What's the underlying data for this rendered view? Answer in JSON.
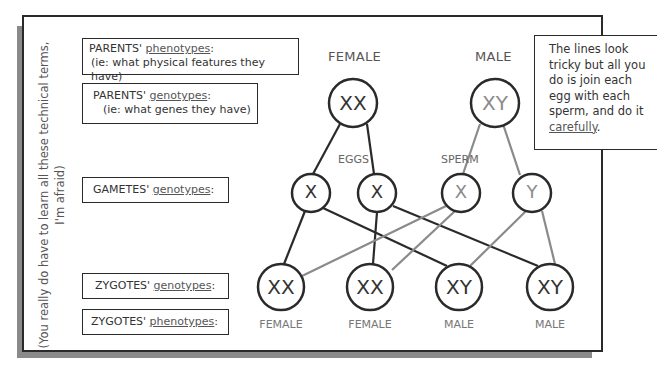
{
  "side_note": {
    "line1": "(You really do have to learn all these technical terms,",
    "line2": "I'm afraid)"
  },
  "labels": {
    "parents_phenotypes": {
      "prefix": "PARENTS' ",
      "term": "phenotypes",
      "suffix": ":",
      "sub": "(ie: what physical features they have)"
    },
    "parents_genotypes": {
      "prefix": "PARENTS' ",
      "term": "genotypes",
      "suffix": ":",
      "sub": "(ie: what genes they have)"
    },
    "gametes_genotypes": {
      "prefix": "GAMETES' ",
      "term": "genotypes",
      "suffix": ":"
    },
    "zygotes_genotypes": {
      "prefix": "ZYGOTES' ",
      "term": "genotypes",
      "suffix": ":"
    },
    "zygotes_phenotypes": {
      "prefix": "ZYGOTES' ",
      "term": "phenotypes",
      "suffix": ":"
    }
  },
  "parents": {
    "female": {
      "label": "FEMALE",
      "genotype": "XX"
    },
    "male": {
      "label": "MALE",
      "genotype": "XY"
    }
  },
  "gamete_groups": {
    "eggs": "EGGS",
    "sperm": "SPERM"
  },
  "gametes": [
    {
      "allele": "X",
      "source": "female"
    },
    {
      "allele": "X",
      "source": "female"
    },
    {
      "allele": "X",
      "source": "male"
    },
    {
      "allele": "Y",
      "source": "male"
    }
  ],
  "zygotes": [
    {
      "genotype": "XX",
      "phenotype": "FEMALE"
    },
    {
      "genotype": "XX",
      "phenotype": "FEMALE"
    },
    {
      "genotype": "XY",
      "phenotype": "MALE"
    },
    {
      "genotype": "XY",
      "phenotype": "MALE"
    }
  ],
  "note": {
    "text": "The lines look tricky but all you do is join each egg with each sperm, and do it ",
    "emphasis": "carefully",
    "end": "."
  },
  "colors": {
    "female_line": "#2a2a2a",
    "male_line": "#8a8a8a",
    "male_text": "#8a8a8a"
  }
}
